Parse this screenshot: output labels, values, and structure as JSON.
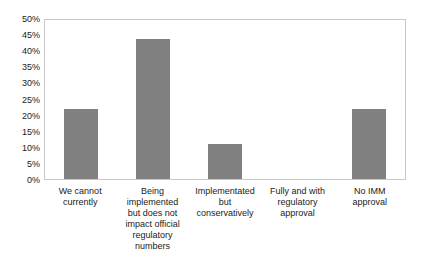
{
  "chart_data": {
    "type": "bar",
    "title": "",
    "subtitle": "",
    "xlabel": "",
    "ylabel": "",
    "categories": [
      "We cannot currently",
      "Being implemented but does not impact official regulatory numbers",
      "Implementated but conservatively",
      "Fully and with regulatory approval",
      "No IMM approval"
    ],
    "values": [
      22,
      44,
      11,
      0,
      22
    ],
    "value_labels": [
      "22%",
      "44%",
      "11%",
      "0%",
      "22%"
    ],
    "ylim": [
      0,
      50
    ],
    "ytick_labels": [
      "50%",
      "45%",
      "40%",
      "35%",
      "30%",
      "25%",
      "20%",
      "15%",
      "10%",
      "5%",
      "0%"
    ],
    "ytick_values": [
      50,
      45,
      40,
      35,
      30,
      25,
      20,
      15,
      10,
      5,
      0
    ],
    "grid": false,
    "legend": false,
    "legend_position": "none",
    "bar_color": "#808080",
    "plot_background": "#ffffff",
    "frame_color": "#c8c8c8",
    "text_color": "#1a1a1a"
  }
}
